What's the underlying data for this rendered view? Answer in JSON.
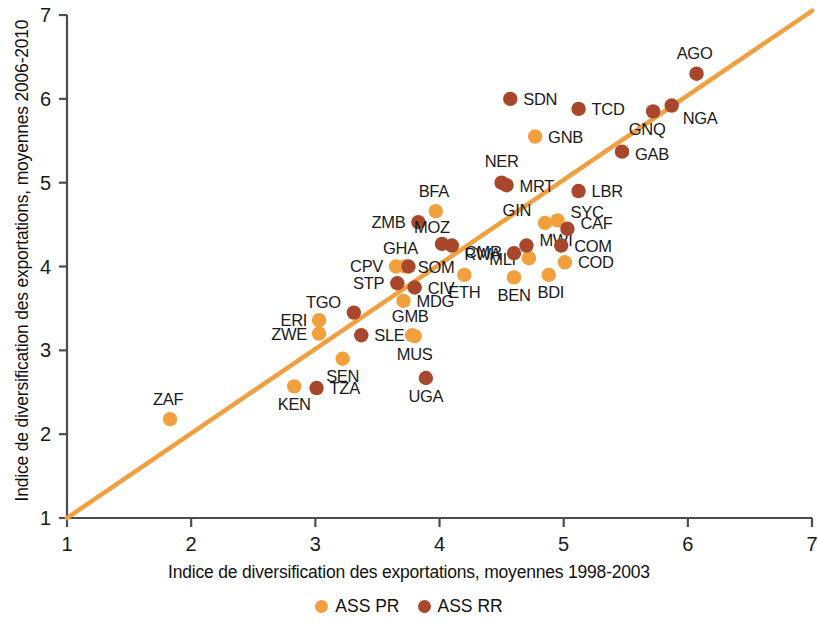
{
  "chart_data": {
    "type": "scatter",
    "title": "",
    "xlabel": "Indice de diversification des exportations, moyennes 1998-2003",
    "ylabel": "Indice de diversification des exportations, moyennes 2006-2010",
    "xlim": [
      1,
      7
    ],
    "ylim": [
      1,
      7
    ],
    "xticks": [
      "1",
      "2",
      "3",
      "4",
      "5",
      "6",
      "7"
    ],
    "yticks": [
      "1",
      "2",
      "3",
      "4",
      "5",
      "6",
      "7"
    ],
    "grid": false,
    "legend_position": "bottom",
    "reference_line": {
      "from": [
        1,
        1
      ],
      "to": [
        7,
        7.05
      ],
      "label": "ligne 45 degres"
    },
    "series": [
      {
        "name": "ASS PR",
        "color": "#f2a03e",
        "points": [
          {
            "label": "ZAF",
            "x": 1.83,
            "y": 2.18,
            "label_dx": -2,
            "label_dy": -14,
            "anchor": "middle"
          },
          {
            "label": "KEN",
            "x": 2.83,
            "y": 2.57,
            "label_dx": 0,
            "label_dy": 24,
            "anchor": "middle"
          },
          {
            "label": "ERI",
            "x": 3.03,
            "y": 3.36,
            "label_dx": -12,
            "label_dy": 6,
            "anchor": "end"
          },
          {
            "label": "ZWE",
            "x": 3.03,
            "y": 3.2,
            "label_dx": -12,
            "label_dy": 6,
            "anchor": "end"
          },
          {
            "label": "SEN",
            "x": 3.22,
            "y": 2.9,
            "label_dx": 0,
            "label_dy": 23,
            "anchor": "middle"
          },
          {
            "label": "CPV",
            "x": 3.65,
            "y": 4.0,
            "label_dx": -13,
            "label_dy": 5,
            "anchor": "end"
          },
          {
            "label": "SOM",
            "x": 3.72,
            "y": 4.0,
            "label_dx": 13,
            "label_dy": 6,
            "anchor": "start"
          },
          {
            "label": "MDG",
            "x": 3.71,
            "y": 3.59,
            "label_dx": 13,
            "label_dy": 6,
            "anchor": "start"
          },
          {
            "label": "GMB",
            "x": 3.78,
            "y": 3.18,
            "label_dx": -2,
            "label_dy": -13,
            "anchor": "middle"
          },
          {
            "label": "BFA",
            "x": 3.97,
            "y": 4.66,
            "label_dx": -2,
            "label_dy": -14,
            "anchor": "middle"
          },
          {
            "label": "MUS",
            "x": 3.8,
            "y": 3.17,
            "label_dx": 0,
            "label_dy": 24,
            "anchor": "middle"
          },
          {
            "label": "ETH",
            "x": 4.2,
            "y": 3.9,
            "label_dx": 0,
            "label_dy": 23,
            "anchor": "middle"
          },
          {
            "label": "BEN",
            "x": 4.6,
            "y": 3.87,
            "label_dx": 0,
            "label_dy": 24,
            "anchor": "middle"
          },
          {
            "label": "MLI",
            "x": 4.72,
            "y": 4.1,
            "label_dx": -13,
            "label_dy": 7,
            "anchor": "end"
          },
          {
            "label": "GIN",
            "x": 4.85,
            "y": 4.52,
            "label_dx": -14,
            "label_dy": -7,
            "anchor": "end"
          },
          {
            "label": "SYC",
            "x": 4.95,
            "y": 4.55,
            "label_dx": 13,
            "label_dy": -2,
            "anchor": "start"
          },
          {
            "label": "COD",
            "x": 5.01,
            "y": 4.05,
            "label_dx": 13,
            "label_dy": 6,
            "anchor": "start"
          },
          {
            "label": "BDI",
            "x": 4.88,
            "y": 3.9,
            "label_dx": 2,
            "label_dy": 23,
            "anchor": "middle"
          },
          {
            "label": "GNB",
            "x": 4.77,
            "y": 5.55,
            "label_dx": 13,
            "label_dy": 6,
            "anchor": "start"
          }
        ]
      },
      {
        "name": "ASS RR",
        "color": "#a8472c",
        "points": [
          {
            "label": "TZA",
            "x": 3.01,
            "y": 2.55,
            "label_dx": 13,
            "label_dy": 6,
            "anchor": "start"
          },
          {
            "label": "TGO",
            "x": 3.31,
            "y": 3.45,
            "label_dx": -13,
            "label_dy": -5,
            "anchor": "end"
          },
          {
            "label": "SLE",
            "x": 3.37,
            "y": 3.18,
            "label_dx": 13,
            "label_dy": 6,
            "anchor": "start"
          },
          {
            "label": "STP",
            "x": 3.66,
            "y": 3.8,
            "label_dx": -13,
            "label_dy": 6,
            "anchor": "end"
          },
          {
            "label": "GHA",
            "x": 3.75,
            "y": 4.0,
            "label_dx": -8,
            "label_dy": -13,
            "anchor": "middle"
          },
          {
            "label": "CIV",
            "x": 3.8,
            "y": 3.75,
            "label_dx": 13,
            "label_dy": 7,
            "anchor": "start"
          },
          {
            "label": "ZMB",
            "x": 3.83,
            "y": 4.53,
            "label_dx": -13,
            "label_dy": 6,
            "anchor": "end"
          },
          {
            "label": "UGA",
            "x": 3.89,
            "y": 2.67,
            "label_dx": 0,
            "label_dy": 24,
            "anchor": "middle"
          },
          {
            "label": "MOZ",
            "x": 4.02,
            "y": 4.27,
            "label_dx": -10,
            "label_dy": -11,
            "anchor": "middle"
          },
          {
            "label": "CMR",
            "x": 4.1,
            "y": 4.25,
            "label_dx": 13,
            "label_dy": 12,
            "anchor": "start"
          },
          {
            "label": "RWA",
            "x": 4.6,
            "y": 4.16,
            "label_dx": -13,
            "label_dy": 7,
            "anchor": "end"
          },
          {
            "label": "MWI",
            "x": 4.7,
            "y": 4.25,
            "label_dx": 13,
            "label_dy": 0,
            "anchor": "start"
          },
          {
            "label": "MRT",
            "x": 4.54,
            "y": 4.97,
            "label_dx": 13,
            "label_dy": 7,
            "anchor": "start"
          },
          {
            "label": "NER",
            "x": 4.5,
            "y": 5.0,
            "label_dx": 0,
            "label_dy": -16,
            "anchor": "middle"
          },
          {
            "label": "SDN",
            "x": 4.57,
            "y": 6.0,
            "label_dx": 13,
            "label_dy": 6,
            "anchor": "start"
          },
          {
            "label": "CAF",
            "x": 5.03,
            "y": 4.45,
            "label_dx": 13,
            "label_dy": 0,
            "anchor": "start"
          },
          {
            "label": "COM",
            "x": 4.98,
            "y": 4.25,
            "label_dx": 13,
            "label_dy": 6,
            "anchor": "start"
          },
          {
            "label": "LBR",
            "x": 5.12,
            "y": 4.9,
            "label_dx": 13,
            "label_dy": 6,
            "anchor": "start"
          },
          {
            "label": "TCD",
            "x": 5.12,
            "y": 5.88,
            "label_dx": 13,
            "label_dy": 6,
            "anchor": "start"
          },
          {
            "label": "GAB",
            "x": 5.47,
            "y": 5.37,
            "label_dx": 13,
            "label_dy": 8,
            "anchor": "start"
          },
          {
            "label": "GNQ",
            "x": 5.72,
            "y": 5.85,
            "label_dx": -6,
            "label_dy": 24,
            "anchor": "middle"
          },
          {
            "label": "NGA",
            "x": 5.87,
            "y": 5.92,
            "label_dx": 11,
            "label_dy": 18,
            "anchor": "start"
          },
          {
            "label": "AGO",
            "x": 6.07,
            "y": 6.3,
            "label_dx": -2,
            "label_dy": -15,
            "anchor": "middle"
          }
        ]
      }
    ]
  },
  "legend": {
    "items": [
      {
        "label": "ASS PR",
        "color": "#f2a03e"
      },
      {
        "label": "ASS RR",
        "color": "#a8472c"
      }
    ]
  },
  "axes": {
    "x_title": "Indice de diversification des exportations, moyennes 1998-2003",
    "y_title": "Indice de diversification des exportations, moyennes 2006-2010"
  }
}
